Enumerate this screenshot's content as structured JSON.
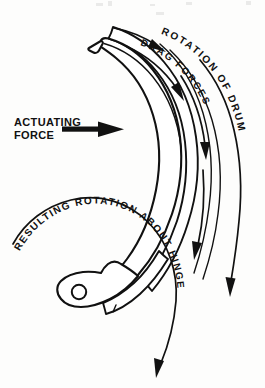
{
  "figure": {
    "name": "drum-brake-shoe-force-diagram",
    "background_color": "#fdfdfc",
    "ink_color": "#111111",
    "width": 265,
    "height": 388
  },
  "labels": {
    "actuating_force": "ACTUATING\nFORCE",
    "rotation_of_drum": "ROTATION OF DRUM",
    "drag_forces": "DRAG FORCES",
    "resulting_rotation": "RESULTING ROTATION ABOUT HINGE"
  },
  "parts": {
    "shoe_web": "brake-shoe-web",
    "shoe_lining": "brake-shoe-lining",
    "hinge_pivot": "hinge-pivot-hole",
    "actuator_tab": "actuator-tab"
  },
  "arrows": {
    "actuating": "straight-block-arrow-pointing-right",
    "drum_rotation": "curved-arrow-clockwise-outer",
    "drag": "curved-arrows-downward-inner",
    "resulting_rotation": "curved-arrow-about-hinge"
  }
}
